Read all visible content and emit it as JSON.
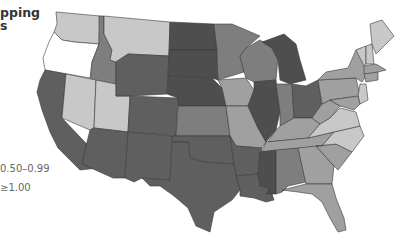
{
  "title": {
    "line1": "pping",
    "line2": "s"
  },
  "legend": {
    "items": [
      {
        "label": "0.50–0.99",
        "color": "#8a8a8a"
      },
      {
        "label": "≥1.00",
        "color": "#5e5e5e"
      }
    ]
  },
  "colors": {
    "white": "#ffffff",
    "light": "#c8c8c8",
    "mid": "#a0a0a0",
    "darkmid": "#7e7e7e",
    "dark": "#5f5f5f",
    "darkest": "#4e4e4e"
  },
  "states": [
    {
      "id": "WA",
      "shade": "light"
    },
    {
      "id": "OR",
      "shade": "white"
    },
    {
      "id": "CA",
      "shade": "dark"
    },
    {
      "id": "ID",
      "shade": "darkmid"
    },
    {
      "id": "NV",
      "shade": "light"
    },
    {
      "id": "UT",
      "shade": "light"
    },
    {
      "id": "AZ",
      "shade": "dark"
    },
    {
      "id": "MT",
      "shade": "light"
    },
    {
      "id": "WY",
      "shade": "dark"
    },
    {
      "id": "CO",
      "shade": "dark"
    },
    {
      "id": "NM",
      "shade": "dark"
    },
    {
      "id": "ND",
      "shade": "darkest"
    },
    {
      "id": "SD",
      "shade": "darkest"
    },
    {
      "id": "NE",
      "shade": "darkest"
    },
    {
      "id": "KS",
      "shade": "darkmid"
    },
    {
      "id": "OK",
      "shade": "dark"
    },
    {
      "id": "TX",
      "shade": "dark"
    },
    {
      "id": "MN",
      "shade": "darkmid"
    },
    {
      "id": "IA",
      "shade": "mid"
    },
    {
      "id": "MO",
      "shade": "mid"
    },
    {
      "id": "AR",
      "shade": "dark"
    },
    {
      "id": "LA",
      "shade": "dark"
    },
    {
      "id": "WI",
      "shade": "darkmid"
    },
    {
      "id": "IL",
      "shade": "darkest"
    },
    {
      "id": "MI",
      "shade": "darkest"
    },
    {
      "id": "IN",
      "shade": "darkmid"
    },
    {
      "id": "OH",
      "shade": "dark"
    },
    {
      "id": "KY",
      "shade": "mid"
    },
    {
      "id": "TN",
      "shade": "mid"
    },
    {
      "id": "MS",
      "shade": "darkest"
    },
    {
      "id": "AL",
      "shade": "darkmid"
    },
    {
      "id": "GA",
      "shade": "mid"
    },
    {
      "id": "FL",
      "shade": "mid"
    },
    {
      "id": "SC",
      "shade": "mid"
    },
    {
      "id": "NC",
      "shade": "light"
    },
    {
      "id": "VA",
      "shade": "light"
    },
    {
      "id": "WV",
      "shade": "mid"
    },
    {
      "id": "PA",
      "shade": "mid"
    },
    {
      "id": "NY",
      "shade": "mid"
    },
    {
      "id": "VT",
      "shade": "light"
    },
    {
      "id": "NH",
      "shade": "light"
    },
    {
      "id": "ME",
      "shade": "light"
    },
    {
      "id": "MA",
      "shade": "mid"
    },
    {
      "id": "CT",
      "shade": "mid"
    },
    {
      "id": "NJ",
      "shade": "light"
    },
    {
      "id": "MD",
      "shade": "mid"
    }
  ]
}
